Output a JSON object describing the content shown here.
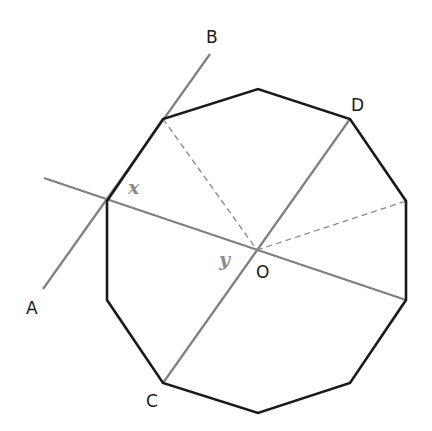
{
  "diagram": {
    "colors": {
      "polygon": "#1a1a1a",
      "lines": "#7f7f7f",
      "dashed": "#8a8a8a",
      "labels": "#1a1a1a",
      "angle_labels": "#8a8a8a"
    },
    "points": {
      "A": {
        "label": "A"
      },
      "B": {
        "label": "B"
      },
      "C": {
        "label": "C"
      },
      "D": {
        "label": "D"
      },
      "O": {
        "label": "O"
      }
    },
    "angles": {
      "x": {
        "label": "x"
      },
      "y": {
        "label": "y"
      }
    }
  }
}
